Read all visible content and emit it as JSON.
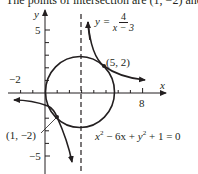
{
  "caption": "The points of intersection are (1, −2) and (5, 2).",
  "axes": {
    "x_label": "x",
    "y_label": "y",
    "x_tick_labels": [
      {
        "value": -2,
        "text": "−2"
      },
      {
        "value": 8,
        "text": "8"
      }
    ],
    "y_tick_labels": [
      {
        "value": 5,
        "text": "5"
      },
      {
        "value": -5,
        "text": "−5"
      }
    ]
  },
  "curves": {
    "hyperbola": {
      "equation_lhs": "y =",
      "numerator": "4",
      "denominator": "x − 3"
    },
    "circle": {
      "equation": "x² − 6x + y² + 1 = 0",
      "eq_x": "x",
      "eq_mid": " − 6x + ",
      "eq_y": "y",
      "eq_end": " + 1 = 0",
      "sup": "2"
    },
    "asymptote": "x = 3"
  },
  "points": [
    {
      "label": "(5, 2)",
      "x": 5,
      "y": 2
    },
    {
      "label": "(1, −2)",
      "x": 1,
      "y": -2
    }
  ],
  "colors": {
    "ink": "#231f20",
    "background": "#ffffff"
  }
}
